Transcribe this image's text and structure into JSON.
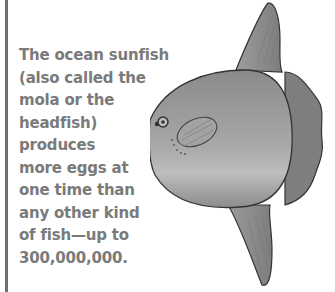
{
  "fact": {
    "lines": [
      "The ocean sunfish",
      "(also called the",
      "mola or the",
      "headfish)",
      "produces",
      "more eggs at",
      "one time than",
      "any other kind",
      "of fish—up to",
      "300,000,000."
    ]
  },
  "illustration": {
    "subject": "ocean sunfish (mola)",
    "icon": "sunfish-illustration"
  },
  "colors": {
    "text": "#7a7a7a",
    "rule": "#6f6f6f",
    "fish_body": "#9a9a9a",
    "outline": "#333333"
  }
}
